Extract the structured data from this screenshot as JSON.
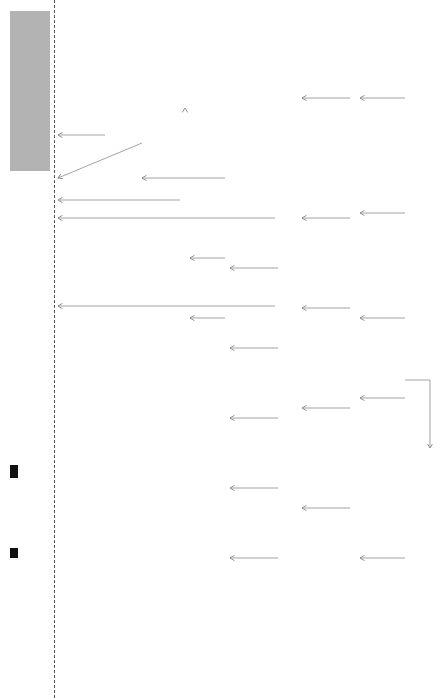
{
  "row_headers": {
    "purpose": "Purpose",
    "benefits": "Benefits",
    "end_benefits": "End benefits",
    "performance_benefits": "Performance benefits",
    "behaviour_title": "Behaviour",
    "behaviour_sub": "(We are doing something new)",
    "competencies_title": "Competencies",
    "competencies_sub": "(We can do something new)",
    "deliverables": "Deliverables"
  },
  "purpose": [
    "Enable strategic portfolio manage-ment",
    "Increase ROI (value) from pro-jects",
    "Increase scope efficiency, especially in compliance projects"
  ],
  "end_benefits": [
    "Improved project prioritisation",
    "Increased benefits realisation of DKK X million per year",
    "Reduced costs by DKK X million per year",
    "Reduced scope in compliance projects of DKK X million per year",
    "Reduced scope in non-compli-ance projects of DKK X million per year"
  ],
  "performance_benefits": [
    "Increased benefits realisation by 25%",
    "Reduced scope in compliance projects by 10% (30% of project costs)",
    "Reduced scope in non-compliance projects by 5% (70% of project costs)",
    "100% of project prio-ritisation is partly based on benefits.",
    "75% of projects have quantifiable benefits (cur-rently 58%).",
    "75% of projects report based on benefits realisation (currently 0%).",
    "90% of projects prepare benefit maps and keep them up to date (currently 0%).",
    "90% of proje-cts have benefit owners (cur-rently 0%)."
  ],
  "behaviour": [
    {
      "bold": "The IT board",
      "text": " prioritises projects (also) based on benefits and ",
      "bold2": "ensures that no projects are closed until the behaviour is changed.",
      "text2": " Also follows up on portfolio benefits realisation and actions to maximise it.",
      "badge": "M"
    },
    {
      "bold": "PMO",
      "text": " facilitates the portfolio prioritisation process and collects benefits realisation learning for future BC.",
      "bold2": "",
      "text2": "",
      "badge": "M"
    },
    {
      "bold": "Benefit owners",
      "text": " define, own, as well as report on benefits after the projects are completed.",
      "bold2": "",
      "text2": "",
      "badge": "L"
    },
    {
      "bold": "Project managers",
      "text": " lead projects to maximise benefits realisation and use the method for project design and to lead the project.",
      "bold2": "",
      "text2": "",
      "badge": "L"
    },
    {
      "bold": "Ørsted's consultants",
      "text": " are method specialists and help project managers lead their projects using the Ørsted approach to benefit real.",
      "bold2": "",
      "text2": "",
      "badge": "M"
    }
  ],
  "competencies": [
    {
      "bold": "The IT board",
      "text": " can: Identify sufficient quality in benefits realisation and change reporting. Know the responsibilities of the benefit owners and project managers and when to request additional info."
    },
    {
      "bold": "PMO",
      "text": " can: Facilitate a prioritisation process with several prioritisation criteria. Determine when benefit quality is sufficient."
    },
    {
      "bold": "Benefit owners",
      "text": " can: Understand the respon-sibility as a benefit owner. Determine when benefits are sufficiently clear."
    },
    {
      "bold": "Project managers",
      "text": " can: Use the benefit map to make/facilitate decisions. Facilitate benefit and change workshops. Do benefit estimation."
    },
    {
      "bold": "Ørsted's consultants",
      "text": " can: Facilitate/advise on benefit and change workshops. Give advice on benefit estimation and measurement."
    }
  ],
  "deliverables": [
    "Benefit follow-up process and reporting",
    "Strengthened portfolio mana-gement process",
    "Updating benefits realisation tools and playbook, project manage-ment, process and roles",
    "Five pilots (to in-crease pilot be-nefit real. and train Ørsted's consultants)",
    "Train all roles (simplified)",
    "Change activi-ties for all roles (simplified)"
  ],
  "caption": "Figure: Benefit map for the IT benefits realisation programme (simplified)"
}
